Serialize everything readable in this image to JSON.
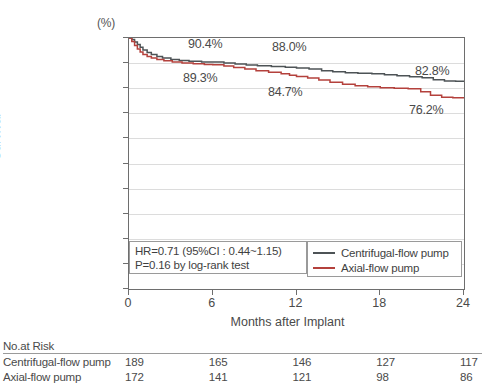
{
  "chart_data": {
    "type": "line",
    "title": "",
    "xlabel": "Months after Implant",
    "ylabel": "Survival",
    "yunit": "(%)",
    "xlim": [
      0,
      24
    ],
    "ylim": [
      0,
      100
    ],
    "xticks": [
      0,
      6,
      12,
      18,
      24
    ],
    "yticks": [
      0,
      10,
      20,
      30,
      40,
      50,
      60,
      70,
      80,
      90,
      100
    ],
    "grid": true,
    "legend_position": "inside-bottom-right",
    "colors": {
      "centrifugal": "#4d5356",
      "axial": "#b4413c",
      "grid": "#dcdcdc",
      "frame": "#6e6e6e",
      "text": "#4a4a4a"
    },
    "series": [
      {
        "name": "Centrifugal-flow pump",
        "color": "#4d5356",
        "points": [
          [
            0.0,
            100.0
          ],
          [
            0.2,
            99.4
          ],
          [
            0.4,
            98.4
          ],
          [
            0.6,
            97.4
          ],
          [
            0.8,
            96.3
          ],
          [
            1.0,
            95.2
          ],
          [
            1.3,
            94.2
          ],
          [
            1.6,
            93.4
          ],
          [
            2.0,
            92.6
          ],
          [
            2.4,
            92.0
          ],
          [
            3.0,
            91.4
          ],
          [
            3.6,
            91.0
          ],
          [
            4.3,
            90.7
          ],
          [
            5.2,
            90.4
          ],
          [
            6.0,
            90.4
          ],
          [
            6.8,
            90.0
          ],
          [
            7.6,
            89.6
          ],
          [
            8.4,
            89.2
          ],
          [
            9.2,
            88.9
          ],
          [
            10.2,
            88.6
          ],
          [
            11.2,
            88.3
          ],
          [
            12.0,
            88.0
          ],
          [
            12.9,
            87.6
          ],
          [
            13.8,
            87.0
          ],
          [
            14.6,
            86.6
          ],
          [
            15.5,
            86.2
          ],
          [
            16.4,
            86.0
          ],
          [
            17.4,
            85.8
          ],
          [
            18.3,
            85.4
          ],
          [
            19.2,
            85.0
          ],
          [
            20.1,
            84.6
          ],
          [
            21.0,
            84.2
          ],
          [
            21.8,
            83.4
          ],
          [
            22.6,
            82.9
          ],
          [
            23.4,
            82.8
          ],
          [
            24.0,
            82.8
          ]
        ]
      },
      {
        "name": "Axial-flow pump",
        "color": "#b4413c",
        "points": [
          [
            0.0,
            100.0
          ],
          [
            0.2,
            98.6
          ],
          [
            0.4,
            97.0
          ],
          [
            0.6,
            95.6
          ],
          [
            0.8,
            94.4
          ],
          [
            1.0,
            93.4
          ],
          [
            1.3,
            92.6
          ],
          [
            1.6,
            92.0
          ],
          [
            2.0,
            91.4
          ],
          [
            2.5,
            90.9
          ],
          [
            3.1,
            90.4
          ],
          [
            3.8,
            90.0
          ],
          [
            4.6,
            89.7
          ],
          [
            5.4,
            89.4
          ],
          [
            6.0,
            89.3
          ],
          [
            6.8,
            88.8
          ],
          [
            7.5,
            88.2
          ],
          [
            8.3,
            87.6
          ],
          [
            9.1,
            87.0
          ],
          [
            10.0,
            86.4
          ],
          [
            10.9,
            85.8
          ],
          [
            11.5,
            85.2
          ],
          [
            12.0,
            84.7
          ],
          [
            12.8,
            84.1
          ],
          [
            13.6,
            83.3
          ],
          [
            14.4,
            82.4
          ],
          [
            15.3,
            81.6
          ],
          [
            16.2,
            81.0
          ],
          [
            17.1,
            80.6
          ],
          [
            18.0,
            80.2
          ],
          [
            19.0,
            80.0
          ],
          [
            20.0,
            79.8
          ],
          [
            20.9,
            78.6
          ],
          [
            21.6,
            77.2
          ],
          [
            22.4,
            76.4
          ],
          [
            23.2,
            76.2
          ],
          [
            24.0,
            76.2
          ]
        ]
      }
    ],
    "annotations": [
      {
        "text": "90.4%",
        "x_px": 188,
        "y_px": 37,
        "series": "centrifugal"
      },
      {
        "text": "89.3%",
        "x_px": 183,
        "y_px": 71,
        "series": "axial"
      },
      {
        "text": "88.0%",
        "x_px": 272,
        "y_px": 40,
        "series": "centrifugal"
      },
      {
        "text": "84.7%",
        "x_px": 268,
        "y_px": 85,
        "series": "axial"
      },
      {
        "text": "82.8%",
        "x_px": 415,
        "y_px": 64,
        "series": "centrifugal"
      },
      {
        "text": "76.2%",
        "x_px": 409,
        "y_px": 103,
        "series": "axial"
      }
    ]
  },
  "stats": {
    "line1": "HR=0.71  (95%CI : 0.44~1.15)",
    "line2": "P=0.16 by log-rank test"
  },
  "legend": {
    "items": [
      {
        "label": "Centrifugal-flow pump",
        "color": "#4d5356"
      },
      {
        "label": "Axial-flow pump",
        "color": "#b4413c"
      }
    ]
  },
  "risk_table": {
    "title": "No.at Risk",
    "columns": [
      "0",
      "6",
      "12",
      "18",
      "24"
    ],
    "rows": [
      {
        "label": "Centrifugal-flow pump",
        "values": [
          "189",
          "165",
          "146",
          "127",
          "117"
        ]
      },
      {
        "label": "Axial-flow pump",
        "values": [
          "172",
          "141",
          "121",
          "98",
          "86"
        ]
      }
    ]
  }
}
